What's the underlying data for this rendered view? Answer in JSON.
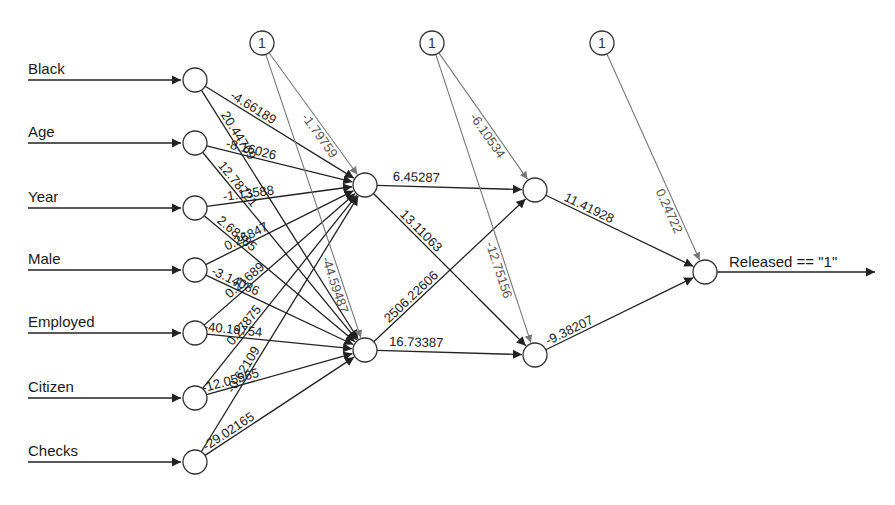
{
  "diagram": {
    "type": "neural-network",
    "colors": {
      "edge": "#222222",
      "bias_edge": "#777777",
      "node_stroke": "#333333",
      "node_fill": "#ffffff",
      "background": "#ffffff"
    },
    "inputs": [
      {
        "label": "Black",
        "x": 195,
        "y": 80
      },
      {
        "label": "Age",
        "x": 195,
        "y": 143
      },
      {
        "label": "Year",
        "x": 195,
        "y": 208
      },
      {
        "label": "Male",
        "x": 195,
        "y": 270
      },
      {
        "label": "Employed",
        "x": 195,
        "y": 333
      },
      {
        "label": "Citizen",
        "x": 195,
        "y": 398
      },
      {
        "label": "Checks",
        "x": 195,
        "y": 462
      }
    ],
    "hidden1": [
      {
        "x": 365,
        "y": 185
      },
      {
        "x": 365,
        "y": 350
      }
    ],
    "hidden2": [
      {
        "x": 535,
        "y": 190
      },
      {
        "x": 535,
        "y": 355
      }
    ],
    "output": {
      "x": 705,
      "y": 272,
      "label": "Released == \"1\""
    },
    "bias_nodes": [
      {
        "label": "1",
        "x": 262,
        "y": 43
      },
      {
        "label": "1",
        "x": 432,
        "y": 43
      },
      {
        "label": "1",
        "x": 602,
        "y": 43
      }
    ],
    "weights_input_to_h1": [
      {
        "from": "Black",
        "to_h1_0": "-4.66189",
        "to_h1_1": "20.44769"
      },
      {
        "from": "Age",
        "to_h1_0": "-8.16026",
        "to_h1_1": "12.78721"
      },
      {
        "from": "Year",
        "to_h1_0": "-1.13588",
        "to_h1_1": "2.68385"
      },
      {
        "from": "Male",
        "to_h1_0": "0.26847",
        "to_h1_1": "-3.14086"
      },
      {
        "from": "Employed",
        "to_h1_0": "0.21689",
        "to_h1_1": "-40.19754"
      },
      {
        "from": "Citizen",
        "to_h1_0": "0.27875",
        "to_h1_1": "-12.05565"
      },
      {
        "from": "Checks",
        "to_h1_0": "-0.62109",
        "to_h1_1": "-29.02165"
      }
    ],
    "bias_h1": [
      "-1.79759",
      "-44.59487"
    ],
    "weights_h1_to_h2": {
      "h1_0_h2_0": "6.45287",
      "h1_0_h2_1": "13.11063",
      "h1_1_h2_0": "2506.22606",
      "h1_1_h2_1": "16.73387"
    },
    "bias_h2": [
      "-6.10534",
      "-12.75156"
    ],
    "weights_h2_to_out": [
      "11.41928",
      "-9.38207"
    ],
    "bias_out": "0.24722"
  }
}
